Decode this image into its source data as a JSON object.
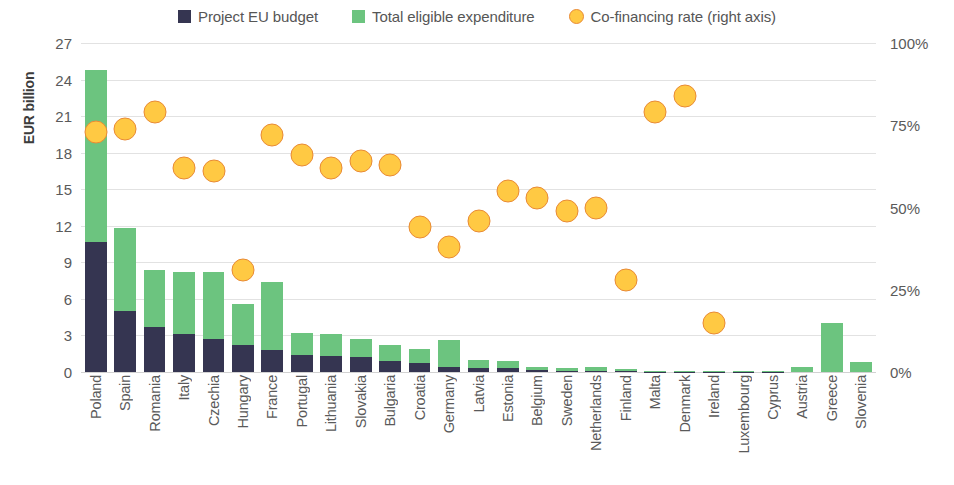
{
  "legend": {
    "items": [
      {
        "label": "Project EU budget",
        "color": "#353551",
        "shape": "square"
      },
      {
        "label": "Total eligible expenditure",
        "color": "#6cc47f",
        "shape": "square"
      },
      {
        "label": "Co-financing rate (right axis)",
        "color": "#ffc943",
        "shape": "circle"
      }
    ]
  },
  "axes": {
    "y_left_title": "EUR billion",
    "y_left_ticks": [
      "27",
      "24",
      "21",
      "18",
      "15",
      "12",
      "9",
      "6",
      "3",
      "0"
    ],
    "y_right_ticks": [
      "100%",
      "75%",
      "50%",
      "25%",
      "0%"
    ]
  },
  "chart_data": {
    "type": "bar",
    "title": "",
    "subtitle": "",
    "xlabel": "",
    "ylabel": "EUR billion",
    "ylabel_right": "Co-financing rate",
    "ylim": [
      0,
      27
    ],
    "ylim_right": [
      0,
      100
    ],
    "ytick_step": 3,
    "ytick_step_right": 25,
    "grid": true,
    "legend_position": "top-center",
    "stacked": true,
    "categories": [
      "Poland",
      "Spain",
      "Romania",
      "Italy",
      "Czechia",
      "Hungary",
      "France",
      "Portugal",
      "Lithuania",
      "Slovakia",
      "Bulgaria",
      "Croatia",
      "Germany",
      "Latvia",
      "Estonia",
      "Belgium",
      "Sweden",
      "Netherlands",
      "Finland",
      "Malta",
      "Denmark",
      "Ireland",
      "Luxembourg",
      "Cyprus",
      "Austria",
      "Greece",
      "Slovenia"
    ],
    "series": [
      {
        "name": "Total eligible expenditure",
        "color": "#6cc47f",
        "axis": "left",
        "units": "EUR billion",
        "values": [
          24.8,
          11.8,
          8.4,
          8.2,
          8.2,
          5.6,
          7.4,
          3.2,
          3.1,
          2.7,
          2.2,
          1.9,
          2.6,
          0.95,
          0.9,
          0.45,
          0.35,
          0.4,
          0.25,
          0.1,
          0.1,
          0.1,
          0.05,
          0.05,
          0.4,
          4.0,
          0.8
        ]
      },
      {
        "name": "Project EU budget",
        "color": "#353551",
        "axis": "left",
        "units": "EUR billion",
        "values": [
          10.7,
          5.0,
          3.7,
          3.1,
          2.7,
          2.2,
          1.8,
          1.4,
          1.3,
          1.2,
          0.9,
          0.75,
          0.45,
          0.3,
          0.3,
          0.15,
          0.1,
          0.12,
          0.08,
          0.03,
          0.03,
          0.03,
          0.01,
          0.01,
          0.0,
          0.0,
          0.0
        ]
      },
      {
        "name": "Co-financing rate (right axis)",
        "color": "#ffc943",
        "axis": "right",
        "units": "%",
        "type": "scatter",
        "values": [
          73,
          74,
          79,
          62,
          61,
          31,
          72,
          66,
          62,
          64,
          63,
          44,
          38,
          46,
          55,
          53,
          49,
          50,
          28,
          79,
          84,
          15,
          0,
          0,
          0,
          0,
          0
        ]
      }
    ]
  }
}
